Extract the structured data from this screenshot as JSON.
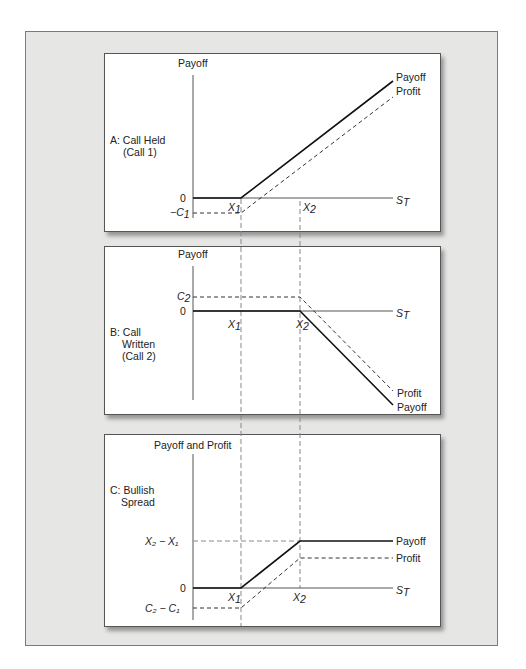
{
  "figure": {
    "type": "option payoff diagram",
    "panels": [
      {
        "id": "A",
        "title_line1": "A: Call Held",
        "title_line2": "(Call 1)",
        "y_axis_label": "Payoff",
        "x_axis_label": "S",
        "x_axis_sub": "T",
        "zero_label": "0",
        "neg_label_prefix": "−C",
        "neg_label_sub": "1",
        "x1_label": "X",
        "x1_sub": "1",
        "x2_label": "X",
        "x2_sub": "2",
        "legend_payoff": "Payoff",
        "legend_profit": "Profit"
      },
      {
        "id": "B",
        "title_line1": "B: Call",
        "title_line2": "Written",
        "title_line3": "(Call 2)",
        "y_axis_label": "Payoff",
        "x_axis_label": "S",
        "x_axis_sub": "T",
        "zero_label": "0",
        "pos_label": "C",
        "pos_label_sub": "2",
        "x1_label": "X",
        "x1_sub": "1",
        "x2_label": "X",
        "x2_sub": "2",
        "legend_profit": "Profit",
        "legend_payoff": "Payoff"
      },
      {
        "id": "C",
        "title_line1": "C: Bullish",
        "title_line2": "Spread",
        "y_axis_label": "Payoff and Profit",
        "x_axis_label": "S",
        "x_axis_sub": "T",
        "zero_label": "0",
        "upper_label": "X₂ − X₁",
        "lower_label": "C₂ − C₁",
        "x1_label": "X",
        "x1_sub": "1",
        "x2_label": "X",
        "x2_sub": "2",
        "legend_payoff": "Payoff",
        "legend_profit": "Profit"
      }
    ],
    "colors": {
      "frame_bg": "#e6e6e4",
      "panel_bg": "#ffffff",
      "line": "#111111",
      "guide": "#888888"
    }
  }
}
